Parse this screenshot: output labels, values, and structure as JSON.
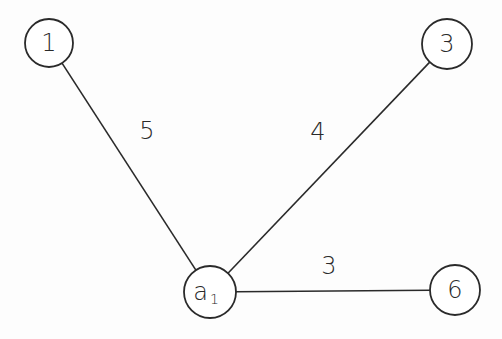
{
  "diagram": {
    "type": "graph",
    "colors": {
      "stroke": "#2a2a2a",
      "background": "#fdfdfd"
    },
    "nodes": [
      {
        "id": "n1",
        "label": "1",
        "sub": "",
        "cx": 49,
        "cy": 43,
        "r": 24
      },
      {
        "id": "n3",
        "label": "3",
        "sub": "",
        "cx": 447,
        "cy": 44,
        "r": 25
      },
      {
        "id": "na1",
        "label": "a",
        "sub": "1",
        "cx": 210,
        "cy": 292,
        "r": 26
      },
      {
        "id": "n6",
        "label": "6",
        "sub": "",
        "cx": 455,
        "cy": 290,
        "r": 25
      }
    ],
    "edges": [
      {
        "from": "n1",
        "to": "na1",
        "weight": "5",
        "lx": 147,
        "ly": 131
      },
      {
        "from": "n3",
        "to": "na1",
        "weight": "4",
        "lx": 318,
        "ly": 132
      },
      {
        "from": "na1",
        "to": "n6",
        "weight": "3",
        "lx": 329,
        "ly": 266
      }
    ]
  }
}
